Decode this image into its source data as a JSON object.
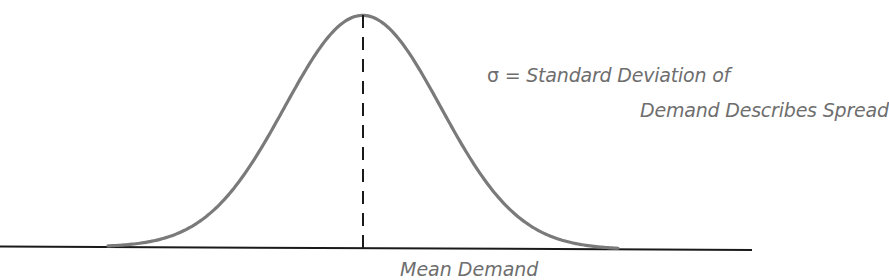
{
  "figure": {
    "type": "normal-distribution-diagram",
    "colors": {
      "curve": "#7a7a7a",
      "axis": "#1a1a1a",
      "mean_line": "#1a1a1a",
      "label_text": "#6e6e6e",
      "background": "#ffffff"
    },
    "sigma_label": {
      "symbol": "σ",
      "equals": " = ",
      "line1": "Standard Deviation of",
      "line2": "Demand Describes Spread"
    },
    "mean_label": {
      "text": "Mean Demand"
    },
    "elements": {
      "curve": "bell-shaped normal curve",
      "mean_line": "vertical dashed line at the mean",
      "axis": "horizontal baseline"
    }
  }
}
